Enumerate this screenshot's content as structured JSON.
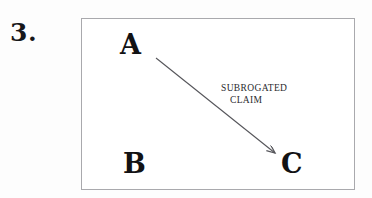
{
  "figure": {
    "item_number": "3.",
    "box": {
      "border_color": "#a9a9ad",
      "fill_color": "#ffffff"
    },
    "nodes": [
      {
        "id": "a",
        "label": "A",
        "x": 120,
        "y": 31
      },
      {
        "id": "b",
        "label": "B",
        "x": 123,
        "y": 150
      },
      {
        "id": "c",
        "label": "C",
        "x": 281,
        "y": 150
      }
    ],
    "arrow": {
      "from": "A",
      "to": "C",
      "label_line_1": "Subrogated",
      "label_line_2": "Claim",
      "color": "#55555a",
      "start_x": 156,
      "start_y": 58,
      "end_x": 278,
      "end_y": 156
    }
  }
}
